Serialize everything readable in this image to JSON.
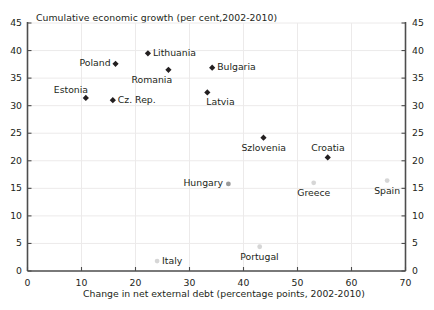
{
  "chart_data": {
    "type": "scatter",
    "title": "Cumulative economic growth (per cent,2002-2010)",
    "xlabel": "Change in net external debt (percentage points, 2002-2010)",
    "ylabel": "",
    "xlim": [
      0,
      70
    ],
    "ylim": [
      0,
      45
    ],
    "xticks": [
      0,
      10,
      20,
      30,
      40,
      50,
      60,
      70
    ],
    "yticks_left": [
      0,
      5,
      10,
      15,
      20,
      25,
      30,
      35,
      40,
      45
    ],
    "yticks_right": [
      0,
      5,
      10,
      15,
      20,
      25,
      30,
      35,
      40,
      45
    ],
    "grid": true,
    "legend": "none",
    "dual_y_axis": true,
    "points": [
      {
        "label": "Estonia",
        "x": 10.8,
        "y": 31.4,
        "marker_color": "#231f20",
        "label_pos": "above-left"
      },
      {
        "label": "Cz. Rep.",
        "x": 15.8,
        "y": 31.0,
        "marker_color": "#231f20",
        "label_pos": "right"
      },
      {
        "label": "Poland",
        "x": 16.3,
        "y": 37.6,
        "marker_color": "#231f20",
        "label_pos": "left"
      },
      {
        "label": "Lithuania",
        "x": 22.3,
        "y": 39.5,
        "marker_color": "#231f20",
        "label_pos": "right"
      },
      {
        "label": "Romania",
        "x": 26.1,
        "y": 36.5,
        "marker_color": "#231f20",
        "label_pos": "below-left"
      },
      {
        "label": "Bulgaria",
        "x": 34.2,
        "y": 36.9,
        "marker_color": "#231f20",
        "label_pos": "right"
      },
      {
        "label": "Latvia",
        "x": 33.3,
        "y": 32.4,
        "marker_color": "#231f20",
        "label_pos": "below-right"
      },
      {
        "label": "Szlovenia",
        "x": 43.7,
        "y": 24.2,
        "marker_color": "#231f20",
        "label_pos": "below"
      },
      {
        "label": "Croatia",
        "x": 55.6,
        "y": 20.6,
        "marker_color": "#231f20",
        "label_pos": "above"
      },
      {
        "label": "Hungary",
        "x": 37.2,
        "y": 15.8,
        "marker_color": "#9a9a9a",
        "label_pos": "left"
      },
      {
        "label": "Greece",
        "x": 53.0,
        "y": 16.0,
        "marker_color": "#d6d6d6",
        "label_pos": "below"
      },
      {
        "label": "Spain",
        "x": 66.6,
        "y": 16.4,
        "marker_color": "#d6d6d6",
        "label_pos": "below"
      },
      {
        "label": "Portugal",
        "x": 43.0,
        "y": 4.4,
        "marker_color": "#d6d6d6",
        "label_pos": "below"
      },
      {
        "label": "Italy",
        "x": 24.0,
        "y": 1.8,
        "marker_color": "#d6d6d6",
        "label_pos": "right"
      }
    ]
  },
  "colors": {
    "axis": "#4d4d4d",
    "grid": "#eceaea",
    "text": "#231f20",
    "marker_dark": "#231f20",
    "marker_mid": "#9a9a9a",
    "marker_light": "#d6d6d6"
  }
}
